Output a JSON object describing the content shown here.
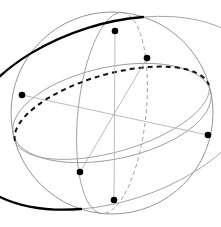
{
  "figure": {
    "type": "geometric-diagram",
    "background_color": "#ffffff",
    "canvas": {
      "width": 221,
      "height": 227
    }
  },
  "sphere": {
    "name": "sphere-outline",
    "center_x": 112,
    "center_y": 113,
    "radius": 101,
    "stroke": "#888888",
    "stroke_width": 0.9,
    "fill": "none"
  },
  "colors": {
    "outline_gray": "#888888",
    "light_gray": "#9a9a9a",
    "axis_gray": "#aaaaaa",
    "bold_black": "#000000",
    "dash_black": "#111111",
    "vertex_fill": "#000000"
  },
  "great_circles": [
    {
      "name": "equator-ellipse",
      "description": "tilted equatorial ellipse, dashed on the far (back) half, thin gray on the near (front) half",
      "rx": 101,
      "ry": 40,
      "rotation_deg": -16,
      "back_style": "dashed",
      "front_style": "solid-thin",
      "back_stroke": "#111111",
      "back_stroke_width": 2.0,
      "front_stroke": "#9a9a9a",
      "front_stroke_width": 0.9,
      "dash_pattern": "5,4"
    },
    {
      "name": "bold-meridian",
      "description": "bold black great circle running upper-left to lower-right, solid on the near half, thin gray on the far half",
      "rx": 101,
      "ry": 58,
      "rotation_deg": 72,
      "front_style": "solid-bold",
      "back_style": "solid-thin",
      "front_stroke": "#000000",
      "front_stroke_width": 2.3,
      "back_stroke": "#9a9a9a",
      "back_stroke_width": 0.9
    },
    {
      "name": "gray-meridian",
      "description": "light gray great circle, near-vertical, solid in front and dashed behind",
      "rx": 101,
      "ry": 34,
      "rotation_deg": 96,
      "front_style": "solid-thin",
      "back_style": "dashed-thin",
      "front_stroke": "#9a9a9a",
      "front_stroke_width": 0.9,
      "back_stroke": "#9a9a9a",
      "back_stroke_width": 0.9,
      "dash_pattern": "4,3"
    },
    {
      "name": "gray-upper-arc",
      "description": "thin gray arc crossing the upper portion of the sphere",
      "rx": 101,
      "ry": 46,
      "rotation_deg": -12,
      "stroke": "#9a9a9a",
      "stroke_width": 0.9
    }
  ],
  "axes": [
    {
      "name": "axis-horizontal",
      "x1": 22,
      "y1": 95,
      "x2": 208,
      "y2": 135,
      "stroke": "#aaaaaa",
      "stroke_width": 0.8
    },
    {
      "name": "axis-vertical",
      "x1": 115,
      "y1": 31,
      "x2": 114,
      "y2": 200,
      "stroke": "#aaaaaa",
      "stroke_width": 0.8
    },
    {
      "name": "axis-diagonal",
      "x1": 80,
      "y1": 172,
      "x2": 147,
      "y2": 58,
      "stroke": "#aaaaaa",
      "stroke_width": 0.8
    }
  ],
  "vertices": [
    {
      "name": "vertex-top",
      "label": "top",
      "x": 115,
      "y": 31,
      "r": 3.3
    },
    {
      "name": "vertex-upper-right",
      "label": "upper-right",
      "x": 147,
      "y": 58,
      "r": 3.3
    },
    {
      "name": "vertex-left",
      "label": "left",
      "x": 22,
      "y": 95,
      "r": 3.3
    },
    {
      "name": "vertex-right",
      "label": "right",
      "x": 208,
      "y": 135,
      "r": 3.3
    },
    {
      "name": "vertex-lower-left",
      "label": "lower-left",
      "x": 80,
      "y": 172,
      "r": 3.3
    },
    {
      "name": "vertex-bottom",
      "label": "bottom",
      "x": 114,
      "y": 200,
      "r": 3.3
    }
  ],
  "chart_data": {
    "type": "scatter",
    "title": "",
    "xlabel": "",
    "ylabel": "",
    "x": [
      115,
      147,
      22,
      208,
      80,
      114
    ],
    "y": [
      31,
      58,
      95,
      135,
      172,
      200
    ],
    "point_labels": [
      "top",
      "upper-right",
      "left",
      "right",
      "lower-left",
      "bottom"
    ],
    "xlim": [
      0,
      221
    ],
    "ylim": [
      0,
      227
    ],
    "grid": false,
    "legend": "none"
  }
}
